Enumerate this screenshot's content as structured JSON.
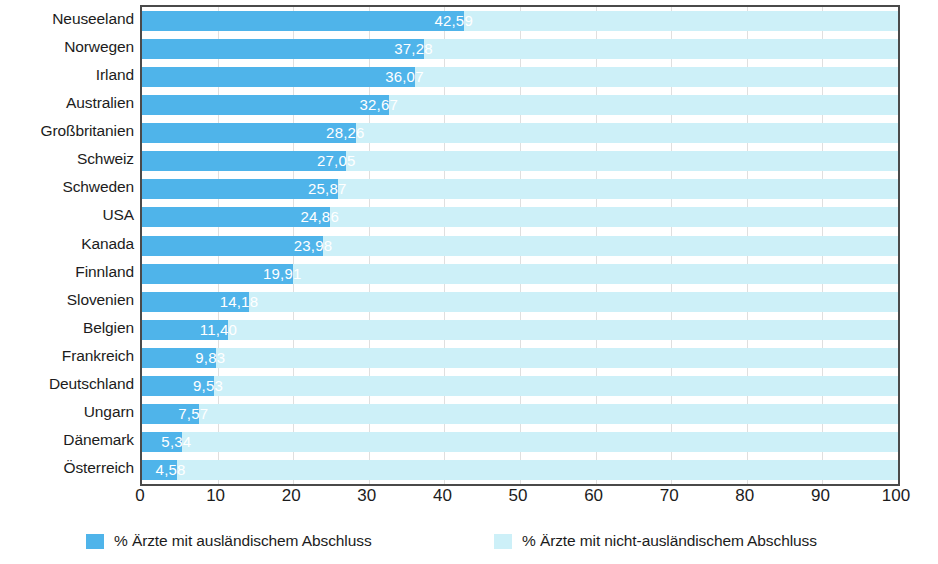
{
  "chart_data": {
    "type": "bar",
    "orientation": "horizontal",
    "stacked": true,
    "title": "",
    "subtitle": "",
    "xlabel": "",
    "ylabel": "",
    "xlim": [
      0,
      100
    ],
    "xticks": [
      "0",
      "10",
      "20",
      "30",
      "40",
      "50",
      "60",
      "70",
      "80",
      "90",
      "100"
    ],
    "grid": true,
    "grid_axis": "x",
    "legend_position": "bottom",
    "categories": [
      "Neuseeland",
      "Norwegen",
      "Irland",
      "Australien",
      "Großbritanien",
      "Schweiz",
      "Schweden",
      "USA",
      "Kanada",
      "Finnland",
      "Slovenien",
      "Belgien",
      "Frankreich",
      "Deutschland",
      "Ungarn",
      "Dänemark",
      "Österreich"
    ],
    "series": [
      {
        "name": "% Ärzte mit ausländischem Abschluss",
        "color": "#4fb4ea",
        "values": [
          42.59,
          37.28,
          36.07,
          32.67,
          28.26,
          27.05,
          25.87,
          24.86,
          23.98,
          19.91,
          14.18,
          11.4,
          9.83,
          9.53,
          7.57,
          5.34,
          4.58
        ],
        "labels": [
          "42,59",
          "37,28",
          "36,07",
          "32,67",
          "28,26",
          "27,05",
          "25,87",
          "24,86",
          "23,98",
          "19,91",
          "14,18",
          "11,40",
          "9,83",
          "9,53",
          "7,57",
          "5,34",
          "4,58"
        ]
      },
      {
        "name": "% Ärzte mit nicht-ausländischem Abschluss",
        "color": "#cdf0f8",
        "values": [
          57.41,
          62.72,
          63.93,
          67.33,
          71.74,
          72.95,
          74.13,
          75.14,
          76.02,
          80.09,
          85.82,
          88.6,
          90.17,
          90.47,
          92.43,
          94.66,
          95.42
        ],
        "labels": []
      }
    ]
  },
  "legend": {
    "items": [
      {
        "label": "% Ärzte mit ausländischem Abschluss",
        "color": "#4fb4ea",
        "swatch_name": "legend-swatch-foreign"
      },
      {
        "label": "% Ärzte mit nicht-ausländischem Abschluss",
        "color": "#cdf0f8",
        "swatch_name": "legend-swatch-domestic"
      }
    ]
  },
  "colors": {
    "foreign": "#4fb4ea",
    "domestic": "#cdf0f8",
    "axis": "#4a4a4a",
    "grid": "#d9d9d9",
    "text": "#1c1c1c",
    "value_text": "#ffffff",
    "background": "#ffffff"
  }
}
